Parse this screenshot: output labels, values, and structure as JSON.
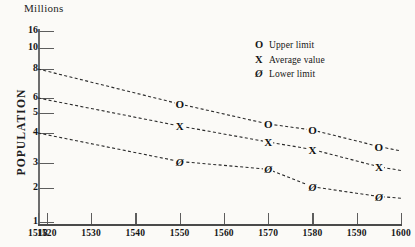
{
  "chart_data": {
    "type": "line",
    "title": "",
    "units_label": "Millions",
    "ylabel": "POPULATION",
    "xlabel": "",
    "grid": false,
    "legend_position": "top-right",
    "x_ticks": [
      1518,
      1520,
      1530,
      1540,
      1550,
      1560,
      1570,
      1580,
      1590,
      1600
    ],
    "x_tick_labels": [
      "1518",
      "1520",
      "1530",
      "1540",
      "1550",
      "1560",
      "1570",
      "1580",
      "1590",
      "1600"
    ],
    "xlim": [
      1518,
      1600
    ],
    "y_ticks": [
      1,
      2,
      3,
      4,
      5,
      6,
      8,
      10,
      16
    ],
    "y_tick_labels": [
      "1",
      "2",
      "3",
      "4",
      "5",
      "6",
      "8",
      "10",
      "16"
    ],
    "ylim": [
      1,
      16
    ],
    "y_scale": "non-linear",
    "series": [
      {
        "name": "Upper limit",
        "symbol": "O",
        "x": [
          1518,
          1550,
          1570,
          1580,
          1595,
          1600
        ],
        "values": [
          8.0,
          5.6,
          4.45,
          4.15,
          3.55,
          3.4
        ],
        "marker_points": [
          {
            "x": 1550,
            "y": 5.6
          },
          {
            "x": 1570,
            "y": 4.45
          },
          {
            "x": 1580,
            "y": 4.15
          },
          {
            "x": 1595,
            "y": 3.55
          }
        ]
      },
      {
        "name": "Average value",
        "symbol": "X",
        "x": [
          1518,
          1550,
          1570,
          1580,
          1595,
          1600
        ],
        "values": [
          6.0,
          4.35,
          3.7,
          3.45,
          2.85,
          2.7
        ],
        "marker_points": [
          {
            "x": 1550,
            "y": 4.35
          },
          {
            "x": 1570,
            "y": 3.7
          },
          {
            "x": 1580,
            "y": 3.45
          },
          {
            "x": 1595,
            "y": 2.85
          }
        ]
      },
      {
        "name": "Lower limit",
        "symbol": "Ø",
        "x": [
          1518,
          1550,
          1570,
          1580,
          1595,
          1600
        ],
        "values": [
          4.0,
          3.05,
          2.75,
          2.05,
          1.75,
          1.7
        ],
        "marker_points": [
          {
            "x": 1550,
            "y": 3.05
          },
          {
            "x": 1570,
            "y": 2.75
          },
          {
            "x": 1580,
            "y": 2.05
          },
          {
            "x": 1595,
            "y": 1.75
          }
        ]
      }
    ]
  },
  "legend": {
    "items": [
      {
        "symbol": "O",
        "label": "Upper limit"
      },
      {
        "symbol": "X",
        "label": "Average value"
      },
      {
        "symbol": "Ø",
        "label": "Lower limit"
      }
    ]
  },
  "colors": {
    "background": "#fbfaf7",
    "ink": "#151515",
    "axis": "#5d5d5d",
    "series_line": "#2b2b2b"
  }
}
